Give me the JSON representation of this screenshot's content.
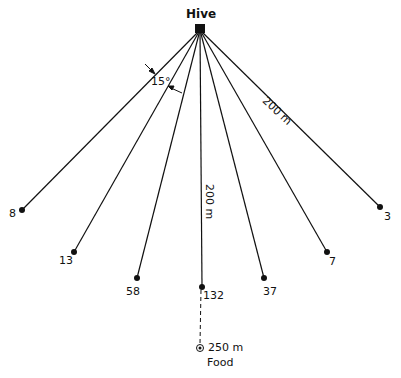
{
  "hive": {
    "label": "Hive",
    "x": 200,
    "y": 29
  },
  "angle_label": "15°",
  "distance_label_diagonal": "200 m",
  "distance_label_vertical": "200 m",
  "food": {
    "label_distance": "250 m",
    "label": "Food",
    "x": 200,
    "y": 348
  },
  "stations": [
    {
      "count": "8",
      "x": 22,
      "y": 210
    },
    {
      "count": "13",
      "x": 74,
      "y": 252
    },
    {
      "count": "58",
      "x": 137,
      "y": 278
    },
    {
      "count": "132",
      "x": 202,
      "y": 287
    },
    {
      "count": "37",
      "x": 264,
      "y": 278
    },
    {
      "count": "7",
      "x": 327,
      "y": 252
    },
    {
      "count": "3",
      "x": 380,
      "y": 207
    }
  ]
}
